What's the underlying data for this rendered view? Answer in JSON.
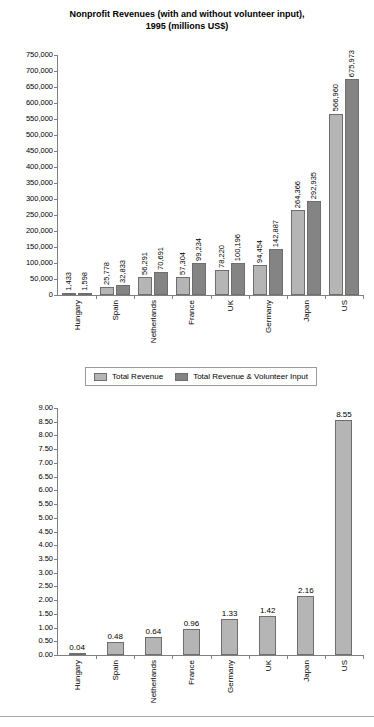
{
  "chart_data": [
    {
      "type": "bar",
      "title": "Nonprofit Revenues (with and without volunteer input), 1995 (millions US$)",
      "title_line1": "Nonprofit Revenues (with and without volunteer input),",
      "title_line2": "1995 (millions US$)",
      "xlabel": "",
      "ylabel": "",
      "ylim": [
        0,
        750000
      ],
      "ytick_step": 50000,
      "grid": false,
      "legend_position": "below-chart",
      "categories": [
        "Hungary",
        "Spain",
        "Netherlands",
        "France",
        "UK",
        "Germany",
        "Japan",
        "US"
      ],
      "ytick_labels": [
        "750,000",
        "700,000",
        "650,000",
        "600,000",
        "550,000",
        "500,000",
        "450,000",
        "400,000",
        "350,000",
        "300,000",
        "250,000",
        "200,000",
        "150,000",
        "100,000",
        "50,000",
        "0"
      ],
      "series": [
        {
          "name": "Total Revenue",
          "color": "#b5b5b5",
          "values": [
            1433,
            25778,
            56291,
            57304,
            78220,
            94454,
            264366,
            566960
          ],
          "labels": [
            "1,433",
            "25,778",
            "56,291",
            "57,304",
            "78,220",
            "94,454",
            "264,366",
            "566,960"
          ]
        },
        {
          "name": "Total Revenue & Volunteer Input",
          "color": "#848484",
          "values": [
            1598,
            32833,
            70691,
            99234,
            100196,
            142887,
            292935,
            675973
          ],
          "labels": [
            "1,598",
            "32,833",
            "70,691",
            "99,234",
            "100,196",
            "142,887",
            "292,935",
            "675,973"
          ]
        }
      ]
    },
    {
      "type": "bar",
      "title": "",
      "xlabel": "",
      "ylabel": "",
      "ylim": [
        0,
        9.0
      ],
      "ytick_step": 0.5,
      "grid": false,
      "categories": [
        "Hungary",
        "Spain",
        "Netherlands",
        "France",
        "Germany",
        "UK",
        "Japan",
        "US"
      ],
      "ytick_labels": [
        "9.00",
        "8.50",
        "8.00",
        "7.50",
        "7.00",
        "6.50",
        "6.00",
        "5.50",
        "5.00",
        "4.50",
        "4.00",
        "3.50",
        "3.00",
        "2.50",
        "2.00",
        "1.50",
        "1.00",
        "0.50",
        "0.00"
      ],
      "series": [
        {
          "name": "Value",
          "color": "#b5b5b5",
          "values": [
            0.04,
            0.48,
            0.64,
            0.96,
            1.33,
            1.42,
            2.16,
            8.55
          ],
          "labels": [
            "0.04",
            "0.48",
            "0.64",
            "0.96",
            "1.33",
            "1.42",
            "2.16",
            "8.55"
          ]
        }
      ]
    }
  ],
  "legend": {
    "items": [
      {
        "label": "Total Revenue",
        "swatch": "light"
      },
      {
        "label": "Total Revenue & Volunteer Input",
        "swatch": "dark"
      }
    ]
  },
  "colors": {
    "series_light": "#b5b5b5",
    "series_dark": "#848484",
    "axis": "#808080",
    "text": "#000000",
    "background": "#ffffff"
  }
}
